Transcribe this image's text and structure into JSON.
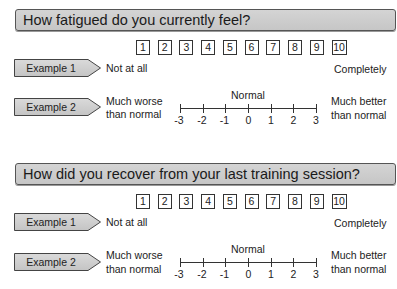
{
  "questions": [
    {
      "title": "How fatigued do you currently feel?",
      "example1": {
        "label": "Example 1",
        "scale": [
          "1",
          "2",
          "3",
          "4",
          "5",
          "6",
          "7",
          "8",
          "9",
          "10"
        ],
        "low_anchor": "Not at all",
        "high_anchor": "Completely"
      },
      "example2": {
        "label": "Example 2",
        "low_anchor_line1": "Much worse",
        "low_anchor_line2": "than normal",
        "mid_label": "Normal",
        "ticks": [
          "-3",
          "-2",
          "-1",
          "0",
          "1",
          "2",
          "3"
        ],
        "high_anchor_line1": "Much better",
        "high_anchor_line2": "than normal"
      }
    },
    {
      "title": "How did you recover from your last training session?",
      "example1": {
        "label": "Example 1",
        "scale": [
          "1",
          "2",
          "3",
          "4",
          "5",
          "6",
          "7",
          "8",
          "9",
          "10"
        ],
        "low_anchor": "Not at all",
        "high_anchor": "Completely"
      },
      "example2": {
        "label": "Example 2",
        "low_anchor_line1": "Much worse",
        "low_anchor_line2": "than normal",
        "mid_label": "Normal",
        "ticks": [
          "-3",
          "-2",
          "-1",
          "0",
          "1",
          "2",
          "3"
        ],
        "high_anchor_line1": "Much better",
        "high_anchor_line2": "than normal"
      }
    }
  ],
  "colors": {
    "title_fill": "#cccccc",
    "tag_fill": "#d0d0d0",
    "border": "#444444"
  }
}
